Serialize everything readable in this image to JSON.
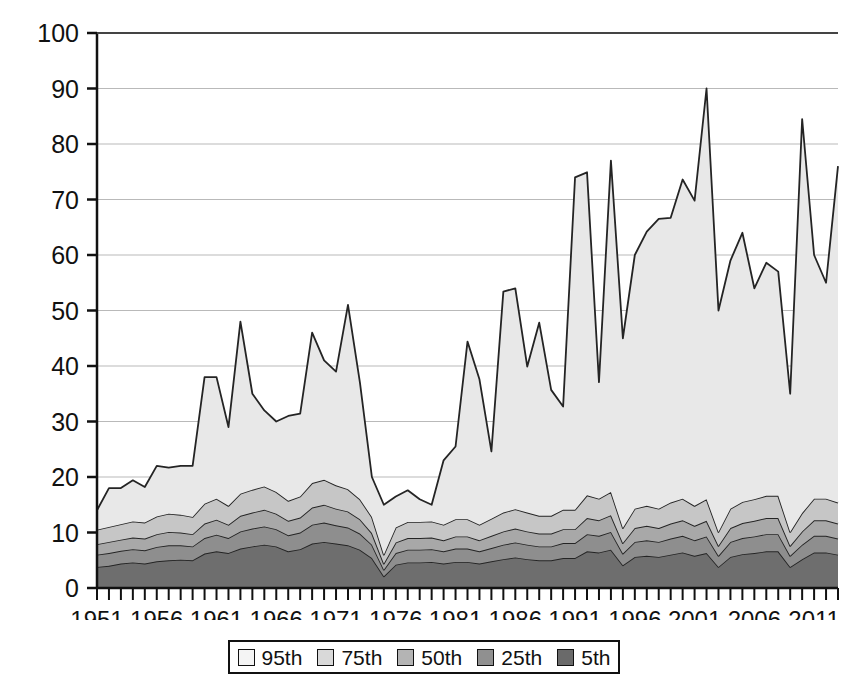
{
  "chart_data": {
    "type": "area",
    "title": "",
    "xlabel": "",
    "ylabel": "",
    "stacked": true,
    "grid": true,
    "legend_position": "bottom",
    "ylim": [
      0,
      100
    ],
    "ytick_values": [
      0,
      10,
      20,
      30,
      40,
      50,
      60,
      70,
      80,
      90,
      100
    ],
    "ytick_labels": [
      "0",
      "10",
      "20",
      "30",
      "40",
      "50",
      "60",
      "70",
      "80",
      "90",
      "100"
    ],
    "xlim": [
      1951,
      2013
    ],
    "xtick_labels": [
      "1951",
      "1956",
      "1961",
      "1966",
      "1971",
      "1976",
      "1981",
      "1986",
      "1991",
      "1996",
      "2001",
      "2006",
      "2011"
    ],
    "xtick_values": [
      1951,
      1956,
      1961,
      1966,
      1971,
      1976,
      1981,
      1986,
      1991,
      1996,
      2001,
      2006,
      2011
    ],
    "xtick_minor_step": 1,
    "x": [
      1951,
      1952,
      1953,
      1954,
      1955,
      1956,
      1957,
      1958,
      1959,
      1960,
      1961,
      1962,
      1963,
      1964,
      1965,
      1966,
      1967,
      1968,
      1969,
      1970,
      1971,
      1972,
      1973,
      1974,
      1975,
      1976,
      1977,
      1978,
      1979,
      1980,
      1981,
      1982,
      1983,
      1984,
      1985,
      1986,
      1987,
      1988,
      1989,
      1990,
      1991,
      1992,
      1993,
      1994,
      1995,
      1996,
      1997,
      1998,
      1999,
      2000,
      2001,
      2002,
      2003,
      2004,
      2005,
      2006,
      2007,
      2008,
      2009,
      2010,
      2011,
      2012,
      2013
    ],
    "series": [
      {
        "name": "5th",
        "color": "#6e6e6e",
        "values": [
          3.8,
          4.0,
          4.4,
          4.6,
          4.4,
          4.8,
          5.0,
          5.1,
          5.0,
          6.2,
          6.6,
          6.3,
          7.1,
          7.5,
          7.8,
          7.5,
          6.6,
          7.0,
          8.0,
          8.3,
          8.0,
          7.7,
          6.9,
          5.4,
          2.1,
          4.2,
          4.6,
          4.6,
          4.7,
          4.4,
          4.7,
          4.7,
          4.4,
          4.8,
          5.2,
          5.5,
          5.2,
          5.0,
          5.0,
          5.4,
          5.4,
          6.6,
          6.4,
          6.9,
          4.1,
          5.6,
          5.8,
          5.6,
          6.0,
          6.4,
          5.8,
          6.3,
          3.8,
          5.6,
          6.1,
          6.3,
          6.6,
          6.6,
          3.8,
          5.2,
          6.4,
          6.4,
          6.0
        ]
      },
      {
        "name": "25th",
        "color": "#8e8e8e",
        "values": [
          2.2,
          2.3,
          2.3,
          2.4,
          2.4,
          2.6,
          2.7,
          2.6,
          2.5,
          2.8,
          3.0,
          2.7,
          3.1,
          3.2,
          3.3,
          3.1,
          2.9,
          3.0,
          3.4,
          3.5,
          3.3,
          3.2,
          2.9,
          2.4,
          1.2,
          2.1,
          2.3,
          2.3,
          2.3,
          2.2,
          2.4,
          2.4,
          2.2,
          2.4,
          2.6,
          2.7,
          2.6,
          2.5,
          2.5,
          2.7,
          2.7,
          3.1,
          3.0,
          3.2,
          2.1,
          2.7,
          2.8,
          2.7,
          2.9,
          3.0,
          2.8,
          3.0,
          2.0,
          2.7,
          2.9,
          3.0,
          3.1,
          3.1,
          2.0,
          2.6,
          3.0,
          3.0,
          2.9
        ]
      },
      {
        "name": "50th",
        "color": "#a8a8a8",
        "values": [
          1.9,
          2.0,
          2.0,
          2.1,
          2.1,
          2.3,
          2.4,
          2.3,
          2.2,
          2.6,
          2.7,
          2.4,
          2.8,
          2.9,
          3.0,
          2.8,
          2.6,
          2.7,
          3.1,
          3.2,
          3.0,
          2.9,
          2.6,
          2.1,
          1.1,
          1.9,
          2.1,
          2.1,
          2.1,
          2.0,
          2.2,
          2.2,
          2.0,
          2.2,
          2.4,
          2.5,
          2.4,
          2.3,
          2.3,
          2.5,
          2.5,
          2.9,
          2.8,
          3.0,
          1.9,
          2.5,
          2.6,
          2.5,
          2.7,
          2.8,
          2.6,
          2.8,
          1.8,
          2.5,
          2.7,
          2.8,
          2.9,
          2.9,
          1.8,
          2.4,
          2.8,
          2.8,
          2.7
        ]
      },
      {
        "name": "75th",
        "color": "#c6c6c6",
        "values": [
          2.6,
          2.7,
          2.8,
          2.9,
          2.9,
          3.2,
          3.3,
          3.2,
          3.1,
          3.6,
          3.8,
          3.4,
          4.0,
          4.1,
          4.2,
          3.9,
          3.6,
          3.8,
          4.4,
          4.5,
          4.2,
          4.0,
          3.6,
          2.9,
          1.6,
          2.7,
          2.9,
          2.9,
          2.9,
          2.8,
          3.1,
          3.1,
          2.8,
          3.1,
          3.4,
          3.5,
          3.4,
          3.2,
          3.2,
          3.5,
          3.5,
          4.1,
          3.9,
          4.2,
          2.7,
          3.5,
          3.6,
          3.5,
          3.8,
          3.9,
          3.6,
          3.9,
          2.5,
          3.5,
          3.8,
          3.9,
          4.0,
          4.0,
          2.5,
          3.3,
          3.9,
          3.9,
          3.8
        ]
      },
      {
        "name": "95th",
        "color": "#e8e8e8",
        "values": [
          3.5,
          7.0,
          6.5,
          7.4,
          6.4,
          9.1,
          8.3,
          8.8,
          9.2,
          22.8,
          21.9,
          14.2,
          31.0,
          17.3,
          13.7,
          12.7,
          15.3,
          14.9,
          27.1,
          21.5,
          20.5,
          33.2,
          21.0,
          7.2,
          9.0,
          5.6,
          5.7,
          4.1,
          3.0,
          11.6,
          13.1,
          32.0,
          26.2,
          12.1,
          39.8,
          39.8,
          26.3,
          34.8,
          22.7,
          18.6,
          59.9,
          58.2,
          21.0,
          59.7,
          34.2,
          45.7,
          49.4,
          52.2,
          51.3,
          57.5,
          55.0,
          74.0,
          39.9,
          44.7,
          48.5,
          38.0,
          42.0,
          40.4,
          24.9,
          71.0,
          43.9,
          38.9,
          60.6
        ]
      }
    ]
  },
  "legend": {
    "items": [
      {
        "label": "95th",
        "color": "#f4f4f4"
      },
      {
        "label": "75th",
        "color": "#d9d9d9"
      },
      {
        "label": "50th",
        "color": "#b4b4b4"
      },
      {
        "label": "25th",
        "color": "#909090"
      },
      {
        "label": "5th",
        "color": "#6a6a6a"
      }
    ]
  }
}
